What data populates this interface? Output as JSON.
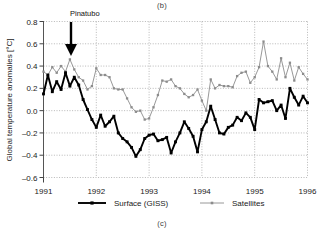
{
  "figure": {
    "panel_label_top": "(b)",
    "panel_label_bottom": "(c)"
  },
  "annotation": {
    "label": "Pinatubo",
    "arrow": "down-arrow",
    "x_value": 1991.5
  },
  "legend": {
    "position": "below-axes",
    "entries": [
      {
        "label": "Surface (GISS)",
        "color": "#000000",
        "marker": "square"
      },
      {
        "label": "Satellites",
        "color": "#8c8c8c",
        "marker": "square"
      }
    ]
  },
  "axes": {
    "y_title": "Global temperature anomalies [°C]",
    "x_title": "",
    "y_ticks": [
      "0.8",
      "0.6",
      "0.4",
      "0.2",
      "0.0",
      "-0.2",
      "-0.4",
      "-0.6"
    ],
    "x_ticks": [
      "1991",
      "1992",
      "1993",
      "1994",
      "1995",
      "1996"
    ],
    "grid": "dotted"
  },
  "chart_data": {
    "type": "line",
    "title": "",
    "subtitle": "",
    "xlabel": "",
    "ylabel": "Global temperature anomalies [°C]",
    "xlim": [
      1991.0,
      1996.0
    ],
    "ylim": [
      -0.6,
      0.8
    ],
    "yticks": [
      -0.6,
      -0.4,
      -0.2,
      0.0,
      0.2,
      0.4,
      0.6,
      0.8
    ],
    "xticks": [
      1991,
      1992,
      1993,
      1994,
      1995,
      1996
    ],
    "grid": true,
    "legend_position": "bottom",
    "annotations": [
      {
        "text": "Pinatubo",
        "x": 1991.5,
        "y": 0.78,
        "arrow": "down"
      },
      {
        "text": "(b)",
        "position": "top-center"
      },
      {
        "text": "(c)",
        "position": "bottom-center"
      }
    ],
    "x": [
      1991.0,
      1991.083,
      1991.167,
      1991.25,
      1991.333,
      1991.417,
      1991.5,
      1991.583,
      1991.667,
      1991.75,
      1991.833,
      1991.917,
      1992.0,
      1992.083,
      1992.167,
      1992.25,
      1992.333,
      1992.417,
      1992.5,
      1992.583,
      1992.667,
      1992.75,
      1992.833,
      1992.917,
      1993.0,
      1993.083,
      1993.167,
      1993.25,
      1993.333,
      1993.417,
      1993.5,
      1993.583,
      1993.667,
      1993.75,
      1993.833,
      1993.917,
      1994.0,
      1994.083,
      1994.167,
      1994.25,
      1994.333,
      1994.417,
      1994.5,
      1994.583,
      1994.667,
      1994.75,
      1994.833,
      1994.917,
      1995.0,
      1995.083,
      1995.167,
      1995.25,
      1995.333,
      1995.417,
      1995.5,
      1995.583,
      1995.667,
      1995.75,
      1995.833,
      1995.917,
      1996.0
    ],
    "series": [
      {
        "name": "Surface (GISS)",
        "color": "#000000",
        "marker": "square",
        "values": [
          0.15,
          0.32,
          0.17,
          0.26,
          0.19,
          0.34,
          0.22,
          0.3,
          0.23,
          0.1,
          0.01,
          -0.08,
          -0.15,
          -0.04,
          -0.14,
          -0.1,
          -0.05,
          -0.2,
          -0.25,
          -0.28,
          -0.33,
          -0.41,
          -0.35,
          -0.25,
          -0.22,
          -0.21,
          -0.27,
          -0.26,
          -0.24,
          -0.38,
          -0.28,
          -0.2,
          -0.1,
          -0.16,
          -0.23,
          -0.37,
          -0.17,
          -0.1,
          0.04,
          -0.08,
          -0.2,
          -0.21,
          -0.15,
          -0.13,
          -0.06,
          -0.09,
          -0.02,
          -0.06,
          -0.17,
          0.1,
          0.07,
          0.08,
          0.09,
          0.0,
          0.05,
          -0.07,
          0.2,
          0.12,
          0.05,
          0.13,
          0.07
        ]
      },
      {
        "name": "Satellites",
        "color": "#8c8c8c",
        "marker": "square",
        "values": [
          0.35,
          0.32,
          0.39,
          0.34,
          0.4,
          0.35,
          0.46,
          0.37,
          0.3,
          0.27,
          0.19,
          0.22,
          0.38,
          0.32,
          0.32,
          0.3,
          0.2,
          0.19,
          0.19,
          0.11,
          0.03,
          -0.01,
          0.0,
          -0.08,
          -0.07,
          0.03,
          0.14,
          0.27,
          0.26,
          0.28,
          0.22,
          0.2,
          0.15,
          0.12,
          0.14,
          0.19,
          0.09,
          0.0,
          0.28,
          0.2,
          0.23,
          0.22,
          0.22,
          0.21,
          0.31,
          0.34,
          0.35,
          0.25,
          0.3,
          0.39,
          0.62,
          0.4,
          0.35,
          0.28,
          0.47,
          0.3,
          0.43,
          0.27,
          0.39,
          0.33,
          0.28
        ]
      }
    ]
  }
}
